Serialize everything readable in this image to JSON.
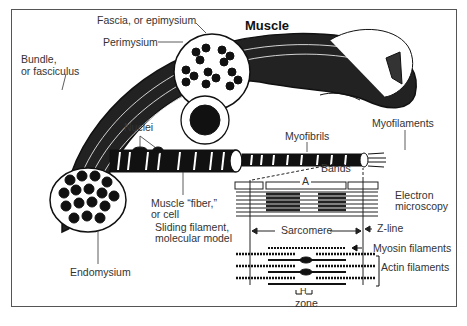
{
  "title": "Muscle",
  "labels": {
    "fascia": "Fascia, or epimysium",
    "perimysium": "Perimysium",
    "bundle_1": "Bundle,",
    "bundle_2": "or fasciculus",
    "nuclei": "Nuclei",
    "myofibrils": "Myofibrils",
    "myofilaments": "Myofilaments",
    "bands": "Bands",
    "a_band": "A",
    "electron_1": "Electron",
    "electron_2": "microscopy",
    "fiber_1": "Muscle “fiber,”",
    "fiber_2": "or cell",
    "sliding_1": "Sliding filament,",
    "sliding_2": "molecular model",
    "sarcomere": "Sarcomere",
    "zline": "Z-line",
    "myosin": "Myosin filaments",
    "actin": "Actin filaments",
    "h": "H",
    "zone": "zone",
    "endomysium": "Endomysium"
  },
  "colors": {
    "ink": "#111111",
    "text": "#333333",
    "paper": "#ffffff"
  }
}
